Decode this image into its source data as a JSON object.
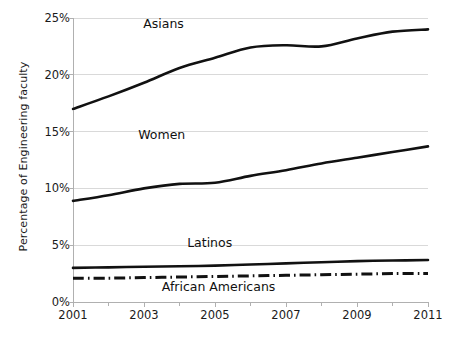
{
  "chart_data": {
    "type": "line",
    "title": "",
    "subtitle": "",
    "xlabel": "",
    "ylabel": "Percentage of  Engineering  faculty",
    "xlim": [
      2001,
      2011
    ],
    "ylim": [
      0,
      25
    ],
    "ytick_labels": [
      "0%",
      "5%",
      "10%",
      "15%",
      "20%",
      "25%"
    ],
    "ytick_values": [
      0,
      5,
      10,
      15,
      20,
      25
    ],
    "xtick_labels": [
      "2001",
      "2003",
      "2005",
      "2007",
      "2009",
      "2011"
    ],
    "xtick_values": [
      2001,
      2003,
      2005,
      2007,
      2009,
      2011
    ],
    "xminor_values": [
      2002,
      2004,
      2006,
      2008,
      2010
    ],
    "grid": "horizontal",
    "legend": "inline-annotations",
    "x": [
      2001,
      2002,
      2003,
      2004,
      2005,
      2006,
      2007,
      2008,
      2009,
      2010,
      2011
    ],
    "series": [
      {
        "name": "Asians",
        "style": "solid",
        "color": "#111111",
        "values": [
          17.0,
          18.1,
          19.3,
          20.6,
          21.5,
          22.4,
          22.6,
          22.5,
          23.2,
          23.8,
          24.0
        ],
        "label_x": 2003.55,
        "label_y": 24.4
      },
      {
        "name": "Women",
        "style": "solid",
        "color": "#111111",
        "values": [
          8.9,
          9.4,
          10.0,
          10.4,
          10.5,
          11.1,
          11.6,
          12.2,
          12.7,
          13.2,
          13.7
        ],
        "label_x": 2003.5,
        "label_y": 14.6
      },
      {
        "name": "Latinos",
        "style": "solid",
        "color": "#111111",
        "values": [
          3.0,
          3.05,
          3.1,
          3.15,
          3.2,
          3.3,
          3.4,
          3.5,
          3.6,
          3.65,
          3.7
        ],
        "label_x": 2004.85,
        "label_y": 5.1
      },
      {
        "name": "African Americans",
        "style": "dash-dot",
        "color": "#111111",
        "values": [
          2.1,
          2.1,
          2.15,
          2.2,
          2.25,
          2.3,
          2.35,
          2.4,
          2.45,
          2.5,
          2.5
        ],
        "label_x": 2005.1,
        "label_y": 1.25
      }
    ],
    "colors": {
      "background": "#ffffff",
      "gridline": "#d9d9d9",
      "axis": "#b0b0b0",
      "text": "#1a1a1a",
      "line": "#111111"
    }
  }
}
